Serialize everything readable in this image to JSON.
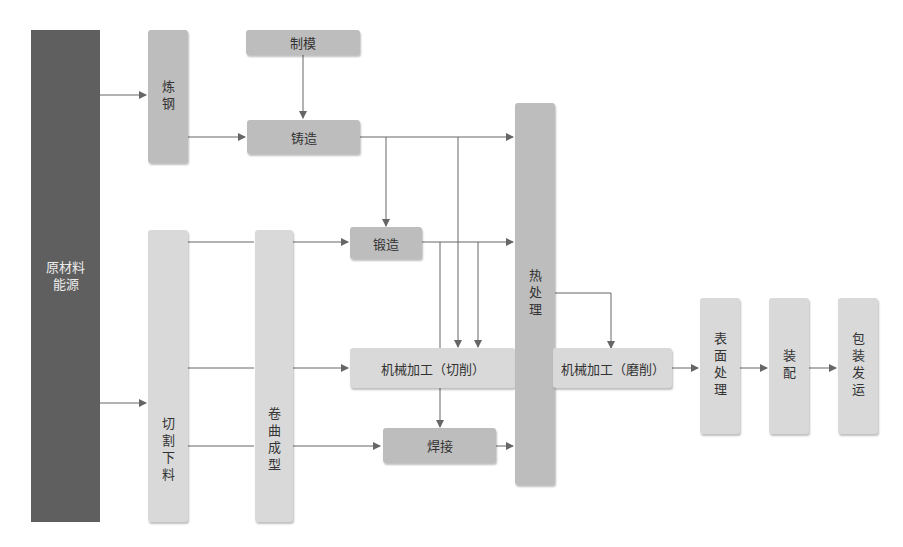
{
  "diagram": {
    "title": "",
    "nodes": {
      "raw": "原材料\n能源",
      "steelmaking": "炼钢",
      "moldmaking": "制模",
      "casting": "铸造",
      "forging": "锻造",
      "cutting_blanking": "切割下料",
      "rolling_forming": "卷曲成型",
      "machining_cut": "机械加工（切削）",
      "welding": "焊接",
      "heat_treatment": "热处理",
      "machining_grind": "机械加工（磨削）",
      "surface_treatment": "表面处理",
      "assembly": "装配",
      "packing_shipping": "包装发运"
    },
    "edges": [
      [
        "raw",
        "steelmaking"
      ],
      [
        "raw",
        "cutting_blanking"
      ],
      [
        "steelmaking",
        "casting"
      ],
      [
        "moldmaking",
        "casting"
      ],
      [
        "casting",
        "forging"
      ],
      [
        "casting",
        "machining_cut"
      ],
      [
        "casting",
        "heat_treatment"
      ],
      [
        "cutting_blanking",
        "forging"
      ],
      [
        "cutting_blanking",
        "machining_cut"
      ],
      [
        "cutting_blanking",
        "welding"
      ],
      [
        "rolling_forming",
        "forging"
      ],
      [
        "rolling_forming",
        "machining_cut"
      ],
      [
        "rolling_forming",
        "welding"
      ],
      [
        "forging",
        "heat_treatment"
      ],
      [
        "forging",
        "machining_cut"
      ],
      [
        "forging",
        "welding"
      ],
      [
        "welding",
        "heat_treatment"
      ],
      [
        "heat_treatment",
        "machining_grind"
      ],
      [
        "machining_grind",
        "surface_treatment"
      ],
      [
        "surface_treatment",
        "assembly"
      ],
      [
        "assembly",
        "packing_shipping"
      ]
    ],
    "colors": {
      "dark": "#5f5f5f",
      "mid": "#bdbdbd",
      "light": "#d9d9d9",
      "connector": "#666666"
    }
  }
}
